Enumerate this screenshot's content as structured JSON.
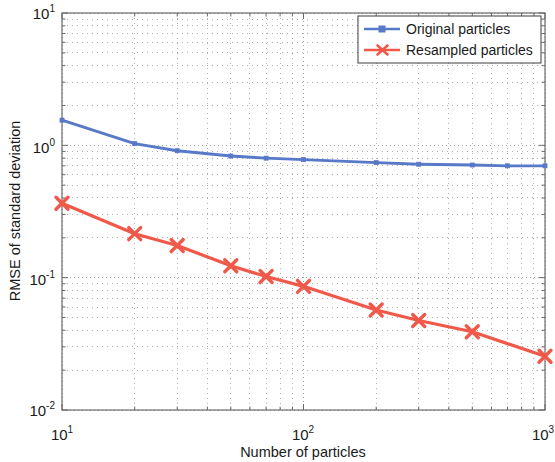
{
  "chart_data": {
    "type": "line",
    "title": "",
    "xlabel": "Number of particles",
    "ylabel": "RMSE of standard deviation",
    "xscale": "log",
    "yscale": "log",
    "xlim": [
      10,
      1000
    ],
    "ylim": [
      0.01,
      10
    ],
    "xticks": [
      10,
      100,
      1000
    ],
    "xticklabels": [
      "10^1",
      "10^2",
      "10^3"
    ],
    "yticks": [
      0.01,
      0.1,
      1,
      10
    ],
    "yticklabels": [
      "10^-2",
      "10^-1",
      "10^0",
      "10^1"
    ],
    "grid": "minor-and-major dotted",
    "legend_position": "upper right",
    "series": [
      {
        "name": "Original particles",
        "color": "#5878c8",
        "marker": "square",
        "x": [
          10,
          20,
          30,
          50,
          70,
          100,
          200,
          300,
          500,
          700,
          1000
        ],
        "y": [
          1.55,
          1.03,
          0.91,
          0.83,
          0.8,
          0.78,
          0.74,
          0.72,
          0.71,
          0.7,
          0.7
        ]
      },
      {
        "name": "Resampled particles",
        "color": "#f0594a",
        "marker": "x",
        "x": [
          10,
          20,
          30,
          50,
          70,
          100,
          200,
          300,
          500,
          1000
        ],
        "y": [
          0.365,
          0.215,
          0.175,
          0.123,
          0.102,
          0.086,
          0.057,
          0.0475,
          0.039,
          0.0255
        ]
      }
    ]
  },
  "axes": {
    "x_label": "Number of particles",
    "y_label": "RMSE of standard deviation",
    "x_tick_bases": [
      "10",
      "10",
      "10"
    ],
    "x_tick_exponents": [
      "1",
      "2",
      "3"
    ],
    "y_tick_bases": [
      "10",
      "10",
      "10",
      "10"
    ],
    "y_tick_exponents": [
      "1",
      "0",
      "-1",
      "-2"
    ]
  },
  "legend": {
    "items": [
      {
        "label": "Original particles",
        "color": "#5878c8",
        "marker": "square"
      },
      {
        "label": "Resampled particles",
        "color": "#f0594a",
        "marker": "x"
      }
    ]
  },
  "style": {
    "axis_color": "#6b6b6b",
    "grid_color": "#9a9a9a",
    "background": "#ffffff",
    "legend_border": "#4d4d4d"
  }
}
